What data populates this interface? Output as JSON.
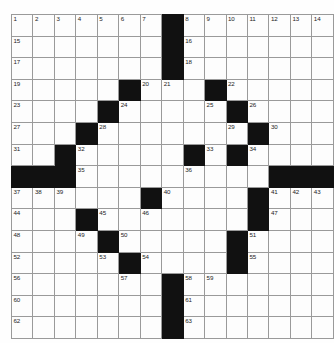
{
  "puzzle": {
    "type": "crossword-grid",
    "rows": 15,
    "columns": 15,
    "cell_size_px": 20.7,
    "colors": {
      "block": "#111111",
      "open_cell": "#fdfdfd",
      "grid_line": "#9a9a9a",
      "number_text": "#1c1c1c",
      "page_background": "#ffffff"
    },
    "highest_clue_number": 63,
    "block_count": 41,
    "blocks": [
      [
        1,
        8
      ],
      [
        2,
        8
      ],
      [
        3,
        8
      ],
      [
        4,
        6
      ],
      [
        4,
        10
      ],
      [
        5,
        5
      ],
      [
        5,
        11
      ],
      [
        6,
        4
      ],
      [
        6,
        12
      ],
      [
        7,
        3
      ],
      [
        7,
        9
      ],
      [
        7,
        11
      ],
      [
        8,
        1
      ],
      [
        8,
        2
      ],
      [
        8,
        3
      ],
      [
        8,
        13
      ],
      [
        8,
        14
      ],
      [
        8,
        15
      ],
      [
        9,
        7
      ],
      [
        9,
        12
      ],
      [
        10,
        4
      ],
      [
        10,
        12
      ],
      [
        11,
        5
      ],
      [
        11,
        11
      ],
      [
        12,
        6
      ],
      [
        12,
        11
      ],
      [
        13,
        8
      ],
      [
        14,
        8
      ],
      [
        15,
        8
      ]
    ],
    "numbered_cells": [
      {
        "number": 1,
        "row": 1,
        "col": 1
      },
      {
        "number": 2,
        "row": 1,
        "col": 2
      },
      {
        "number": 3,
        "row": 1,
        "col": 3
      },
      {
        "number": 4,
        "row": 1,
        "col": 4
      },
      {
        "number": 5,
        "row": 1,
        "col": 5
      },
      {
        "number": 6,
        "row": 1,
        "col": 6
      },
      {
        "number": 7,
        "row": 1,
        "col": 7
      },
      {
        "number": 8,
        "row": 1,
        "col": 9
      },
      {
        "number": 9,
        "row": 1,
        "col": 10
      },
      {
        "number": 10,
        "row": 1,
        "col": 11
      },
      {
        "number": 11,
        "row": 1,
        "col": 12
      },
      {
        "number": 12,
        "row": 1,
        "col": 13
      },
      {
        "number": 13,
        "row": 1,
        "col": 14
      },
      {
        "number": 14,
        "row": 1,
        "col": 15
      },
      {
        "number": 15,
        "row": 2,
        "col": 1
      },
      {
        "number": 16,
        "row": 2,
        "col": 9
      },
      {
        "number": 17,
        "row": 3,
        "col": 1
      },
      {
        "number": 18,
        "row": 3,
        "col": 9
      },
      {
        "number": 19,
        "row": 4,
        "col": 1
      },
      {
        "number": 20,
        "row": 4,
        "col": 7
      },
      {
        "number": 21,
        "row": 4,
        "col": 8
      },
      {
        "number": 22,
        "row": 4,
        "col": 11
      },
      {
        "number": 23,
        "row": 5,
        "col": 1
      },
      {
        "number": 24,
        "row": 5,
        "col": 6
      },
      {
        "number": 25,
        "row": 5,
        "col": 10
      },
      {
        "number": 26,
        "row": 5,
        "col": 12
      },
      {
        "number": 27,
        "row": 6,
        "col": 1
      },
      {
        "number": 28,
        "row": 6,
        "col": 5
      },
      {
        "number": 29,
        "row": 6,
        "col": 11
      },
      {
        "number": 30,
        "row": 6,
        "col": 13
      },
      {
        "number": 31,
        "row": 7,
        "col": 1
      },
      {
        "number": 32,
        "row": 7,
        "col": 4
      },
      {
        "number": 33,
        "row": 7,
        "col": 10
      },
      {
        "number": 34,
        "row": 7,
        "col": 12
      },
      {
        "number": 35,
        "row": 8,
        "col": 4
      },
      {
        "number": 36,
        "row": 8,
        "col": 9
      },
      {
        "number": 37,
        "row": 9,
        "col": 1
      },
      {
        "number": 38,
        "row": 9,
        "col": 2
      },
      {
        "number": 39,
        "row": 9,
        "col": 3
      },
      {
        "number": 40,
        "row": 9,
        "col": 8
      },
      {
        "number": 41,
        "row": 9,
        "col": 13
      },
      {
        "number": 42,
        "row": 9,
        "col": 14
      },
      {
        "number": 43,
        "row": 9,
        "col": 15
      },
      {
        "number": 44,
        "row": 10,
        "col": 1
      },
      {
        "number": 45,
        "row": 10,
        "col": 5
      },
      {
        "number": 46,
        "row": 10,
        "col": 7
      },
      {
        "number": 47,
        "row": 10,
        "col": 13
      },
      {
        "number": 48,
        "row": 11,
        "col": 1
      },
      {
        "number": 49,
        "row": 11,
        "col": 4
      },
      {
        "number": 50,
        "row": 11,
        "col": 6
      },
      {
        "number": 51,
        "row": 11,
        "col": 12
      },
      {
        "number": 52,
        "row": 12,
        "col": 1
      },
      {
        "number": 53,
        "row": 12,
        "col": 5
      },
      {
        "number": 54,
        "row": 12,
        "col": 7
      },
      {
        "number": 55,
        "row": 12,
        "col": 12
      },
      {
        "number": 56,
        "row": 13,
        "col": 1
      },
      {
        "number": 57,
        "row": 13,
        "col": 6
      },
      {
        "number": 58,
        "row": 13,
        "col": 9
      },
      {
        "number": 59,
        "row": 13,
        "col": 10
      },
      {
        "number": 60,
        "row": 14,
        "col": 1
      },
      {
        "number": 61,
        "row": 14,
        "col": 9
      },
      {
        "number": 62,
        "row": 15,
        "col": 1
      },
      {
        "number": 63,
        "row": 15,
        "col": 9
      }
    ],
    "entries": []
  }
}
